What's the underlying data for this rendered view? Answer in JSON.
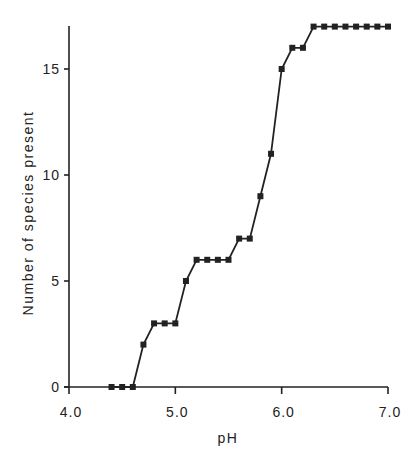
{
  "chart_data": {
    "type": "line",
    "title": "",
    "xlabel": "pH",
    "ylabel": "Number of species present",
    "xlim": [
      4.0,
      7.0
    ],
    "ylim": [
      0,
      17
    ],
    "xticks": [
      "4.0",
      "5.0",
      "6.0",
      "7.0"
    ],
    "yticks": [
      "0",
      "5",
      "10",
      "15"
    ],
    "grid": false,
    "legend": null,
    "marker": "square",
    "series": [
      {
        "name": "Species present",
        "x": [
          4.4,
          4.5,
          4.6,
          4.7,
          4.8,
          4.9,
          5.0,
          5.1,
          5.2,
          5.3,
          5.4,
          5.5,
          5.6,
          5.7,
          5.8,
          5.9,
          6.0,
          6.1,
          6.2,
          6.3,
          6.4,
          6.5,
          6.6,
          6.7,
          6.8,
          6.9,
          7.0
        ],
        "values": [
          0,
          0,
          0,
          2,
          3,
          3,
          3,
          5,
          6,
          6,
          6,
          6,
          7,
          7,
          9,
          11,
          15,
          16,
          16,
          17,
          17,
          17,
          17,
          17,
          17,
          17,
          17
        ]
      }
    ]
  }
}
